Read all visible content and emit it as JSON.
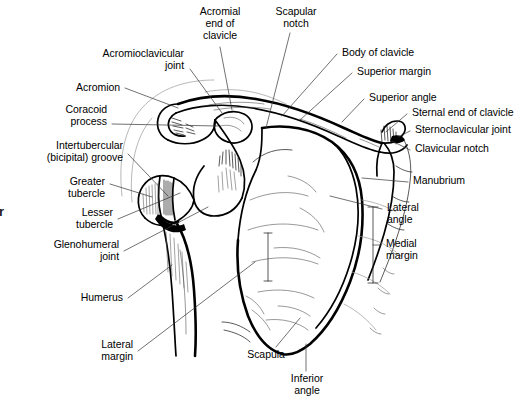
{
  "figure": {
    "background_color": "#ffffff",
    "ink_color": "#000000",
    "corner_mark": "r"
  },
  "labels": {
    "acromial_end_of_clavicle": "Acromial\nend of\nclavicle",
    "scapular_notch": "Scapular\nnotch",
    "acromioclavicular_joint": "Acromioclavicular\njoint",
    "acromion": "Acromion",
    "coracoid_process": "Coracoid\nprocess",
    "intertubercular_groove": "Intertubercular\n(bicipital) groove",
    "greater_tubercle": "Greater\ntubercle",
    "lesser_tubercle": "Lesser\ntubercle",
    "glenohumeral_joint": "Glenohumeral\njoint",
    "humerus": "Humerus",
    "lateral_margin": "Lateral\nmargin",
    "body_of_clavicle": "Body of clavicle",
    "superior_margin": "Superior margin",
    "superior_angle": "Superior angle",
    "sternal_end_of_clavicle": "Sternal end of clavicle",
    "sternoclavicular_joint": "Sternoclavicular joint",
    "clavicular_notch": "Clavicular notch",
    "manubrium": "Manubrium",
    "lateral_angle": "Lateral\nangle",
    "medial_margin": "Medial\nmargin",
    "scapula": "Scapula",
    "inferior_angle": "Inferior\nangle"
  }
}
